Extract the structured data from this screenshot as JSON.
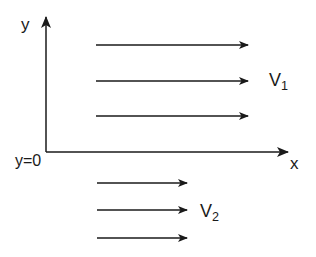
{
  "diagram": {
    "type": "velocity-profile",
    "axes": {
      "y_label": "y",
      "x_label": "x",
      "origin_label": "y=0"
    },
    "upper_region": {
      "label_main": "V",
      "label_sub": "1",
      "arrow_count": 3,
      "arrows": [
        {
          "x1": 96,
          "y": 45,
          "x2": 248
        },
        {
          "x1": 96,
          "y": 81,
          "x2": 248
        },
        {
          "x1": 96,
          "y": 116,
          "x2": 248
        }
      ]
    },
    "lower_region": {
      "label_main": "V",
      "label_sub": "2",
      "arrow_count": 3,
      "arrows": [
        {
          "x1": 97,
          "y": 183,
          "x2": 187
        },
        {
          "x1": 97,
          "y": 210,
          "x2": 187
        },
        {
          "x1": 97,
          "y": 238,
          "x2": 187
        }
      ]
    },
    "colors": {
      "stroke": "#1a1a1a",
      "background": "#ffffff"
    }
  }
}
